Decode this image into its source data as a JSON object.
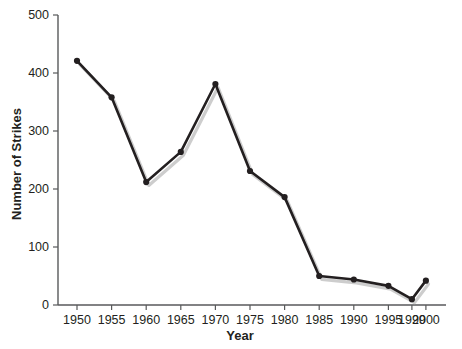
{
  "chart_data": {
    "type": "line",
    "title": "",
    "xlabel": "Year",
    "ylabel": "Number of Strikes",
    "x": [
      1950,
      1955,
      1960,
      1965,
      1970,
      1975,
      1980,
      1985,
      1990,
      1995,
      1999,
      2000
    ],
    "values": [
      421,
      358,
      212,
      264,
      381,
      231,
      186,
      50,
      44,
      33,
      10,
      42
    ],
    "series": [
      {
        "name": "Number of Strikes",
        "values": [
          421,
          358,
          212,
          264,
          381,
          231,
          186,
          50,
          44,
          33,
          10,
          42
        ]
      }
    ],
    "x_tick_labels": [
      "1950",
      "1955",
      "1960",
      "1965",
      "1970",
      "1975",
      "1980",
      "1985",
      "1990",
      "1995",
      "1999",
      "2000"
    ],
    "y_tick_labels": [
      "0",
      "100",
      "200",
      "300",
      "400",
      "500"
    ],
    "y_ticks": [
      0,
      100,
      200,
      300,
      400,
      500
    ],
    "ylim": [
      0,
      500
    ],
    "xlim": [
      1950,
      2000
    ],
    "grid": false,
    "legend": false,
    "line_color": "#231f20",
    "marker_color": "#231f20",
    "axis_color": "#58595b",
    "background_color": "#ffffff"
  }
}
